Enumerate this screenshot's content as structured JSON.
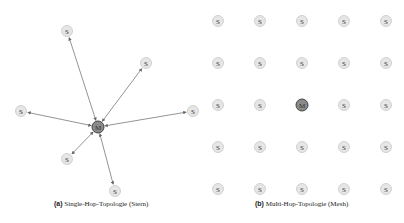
{
  "figure_a": {
    "label": "(a)",
    "caption": "Single-Hop-Topologie (Stern)",
    "master": {
      "label": "M",
      "x": 98,
      "y": 127
    },
    "slaves": [
      {
        "label": "S",
        "x": 67,
        "y": 31
      },
      {
        "label": "S",
        "x": 146,
        "y": 63
      },
      {
        "label": "S",
        "x": 21,
        "y": 111
      },
      {
        "label": "S",
        "x": 193,
        "y": 111
      },
      {
        "label": "S",
        "x": 67,
        "y": 159
      },
      {
        "label": "S",
        "x": 115,
        "y": 191
      }
    ]
  },
  "figure_b": {
    "label": "(b)",
    "caption": "Multi-Hop-Topologie (Mesh)",
    "grid": {
      "rows": 5,
      "cols": 5,
      "x0": 218,
      "y0": 21,
      "dx": 42,
      "dy": 42
    },
    "master_position": {
      "row": 2,
      "col": 2
    },
    "master_label": "M",
    "slave_label": "S"
  },
  "colors": {
    "slave_fill": "#e6e6e6",
    "slave_stroke": "#c8c8c8",
    "master_fill": "#8a8a8a",
    "master_stroke": "#444444",
    "edge": "#666666"
  }
}
